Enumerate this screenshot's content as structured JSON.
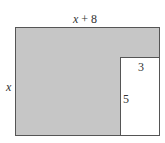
{
  "diagram": {
    "outer_rectangle": {
      "width_label": {
        "var": "x",
        "rest": " + 8"
      },
      "height_label": "x",
      "fill": "#c6c6c6"
    },
    "inner_rectangle": {
      "width_label": "3",
      "height_label": "5",
      "fill": "#ffffff"
    }
  }
}
